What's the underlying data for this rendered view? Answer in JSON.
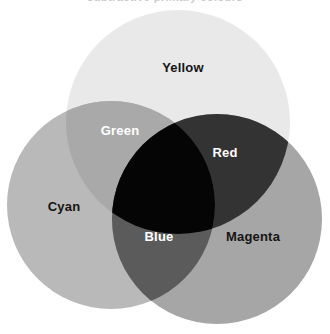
{
  "figure": {
    "title_fragment": "subtractive primary colours",
    "type": "venn-diagram",
    "background_color": "#ffffff",
    "width": 330,
    "height": 334
  },
  "circles": [
    {
      "id": "yellow",
      "name": "Yellow",
      "cx": 178,
      "cy": 122,
      "r": 112,
      "fill": "#e9e9e9"
    },
    {
      "id": "cyan",
      "name": "Cyan",
      "cx": 111,
      "cy": 205,
      "r": 104,
      "fill": "#b9b9b9"
    },
    {
      "id": "magenta",
      "name": "Magenta",
      "cx": 217,
      "cy": 219,
      "r": 105,
      "fill": "#a6a6a6"
    }
  ],
  "labels": [
    {
      "id": "yellow",
      "text": "Yellow",
      "x": 183,
      "y": 67,
      "color": "#151515",
      "tone": "dark",
      "font_size": 13
    },
    {
      "id": "green",
      "text": "Green",
      "x": 120,
      "y": 130,
      "color": "#ffffff",
      "tone": "light",
      "font_size": 13
    },
    {
      "id": "red",
      "text": "Red",
      "x": 225,
      "y": 152,
      "color": "#ffffff",
      "tone": "light",
      "font_size": 13
    },
    {
      "id": "cyan",
      "text": "Cyan",
      "x": 64,
      "y": 206,
      "color": "#151515",
      "tone": "dark",
      "font_size": 13
    },
    {
      "id": "blue",
      "text": "Blue",
      "x": 159,
      "y": 236,
      "color": "#ffffff",
      "tone": "light",
      "font_size": 13
    },
    {
      "id": "magenta",
      "text": "Magenta",
      "x": 253,
      "y": 236,
      "color": "#151515",
      "tone": "dark",
      "font_size": 13
    }
  ],
  "overlap_tones": {
    "green_yellow_cyan": "#a9a9a9",
    "red_yellow_magenta": "#333333",
    "blue_cyan_magenta": "#5b5b5b",
    "center_all_three": "#050505"
  }
}
